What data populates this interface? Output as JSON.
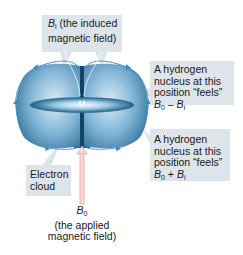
{
  "diagram": {
    "colors": {
      "label_box": "#dde5ea",
      "cloud_dark": "#1f5f86",
      "cloud_light": "#d9ecf6",
      "field_line": "#3b87c4",
      "applied_field_arrow": "#e8a8a6"
    },
    "labels": {
      "induced_field": {
        "symbol": "B",
        "subscript": "i",
        "line1_rest": " (the induced",
        "line2": "magnetic field)"
      },
      "nucleus_minus": {
        "line1": "A hydrogen",
        "line2": "nucleus at this",
        "line3": "position “feels”",
        "expr_b0": "B",
        "expr_b0_sub": "0",
        "operator": " – ",
        "expr_bi": "B",
        "expr_bi_sub": "i"
      },
      "nucleus_plus": {
        "line1": "A hydrogen",
        "line2": "nucleus at this",
        "line3": "position “feels”",
        "expr_b0": "B",
        "expr_b0_sub": "0",
        "operator": " + ",
        "expr_bi": "B",
        "expr_bi_sub": "i"
      },
      "electron_cloud": {
        "line1": "Electron",
        "line2": "cloud"
      },
      "applied_field": {
        "symbol": "B",
        "subscript": "0",
        "line2": "(the applied",
        "line3": "magnetic field)"
      }
    }
  }
}
